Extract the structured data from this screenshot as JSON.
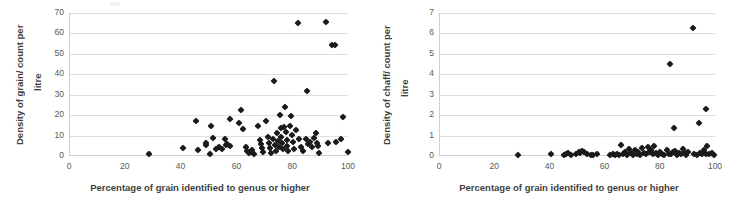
{
  "figure": {
    "background": "#ffffff",
    "marker_color": "#1a1a1a",
    "gridline_color": "#dedede",
    "axis_color": "#d0d0d0",
    "tick_label_color": "#595959",
    "title_color": "#3f3f3f"
  },
  "chart_data": [
    {
      "type": "scatter",
      "title": "",
      "xlabel": "Percentage of grain identified to genus or higher",
      "ylabel_line1": "Density of grain/ count per",
      "ylabel_line2": "litre",
      "xlim": [
        0,
        100
      ],
      "ylim": [
        0,
        70
      ],
      "xticks": [
        0,
        20,
        40,
        60,
        80,
        100
      ],
      "yticks": [
        0,
        10,
        20,
        30,
        40,
        50,
        60,
        70
      ],
      "grid": true,
      "legend": "none",
      "marker": "diamond",
      "points": [
        [
          28.4,
          1.2
        ],
        [
          40.6,
          3.8
        ],
        [
          45.3,
          17.3
        ],
        [
          46.0,
          3.0
        ],
        [
          48.6,
          5.2
        ],
        [
          48.8,
          6.4
        ],
        [
          50.4,
          14.6
        ],
        [
          50.0,
          0.8
        ],
        [
          51.2,
          8.9
        ],
        [
          52.5,
          3.5
        ],
        [
          53.3,
          4.4
        ],
        [
          54.6,
          3.3
        ],
        [
          55.7,
          8.2
        ],
        [
          56.0,
          5.6
        ],
        [
          56.3,
          6.1
        ],
        [
          57.2,
          18.1
        ],
        [
          57.4,
          5.0
        ],
        [
          60.6,
          16.3
        ],
        [
          61.4,
          22.5
        ],
        [
          62.0,
          13.1
        ],
        [
          63.0,
          4.6
        ],
        [
          63.4,
          2.3
        ],
        [
          64.1,
          1.5
        ],
        [
          64.6,
          1.9
        ],
        [
          65.4,
          3.0
        ],
        [
          66.0,
          0.9
        ],
        [
          67.4,
          14.8
        ],
        [
          68.0,
          7.9
        ],
        [
          68.4,
          6.0
        ],
        [
          68.9,
          4.0
        ],
        [
          69.2,
          2.0
        ],
        [
          70.3,
          17.1
        ],
        [
          70.8,
          9.4
        ],
        [
          71.2,
          6.6
        ],
        [
          71.6,
          3.9
        ],
        [
          72.0,
          1.6
        ],
        [
          72.7,
          8.4
        ],
        [
          73.0,
          36.8
        ],
        [
          73.4,
          5.4
        ],
        [
          73.8,
          2.6
        ],
        [
          74.3,
          11.4
        ],
        [
          74.6,
          7.5
        ],
        [
          74.9,
          4.6
        ],
        [
          75.2,
          19.9
        ],
        [
          75.5,
          13.8
        ],
        [
          75.8,
          9.1
        ],
        [
          76.1,
          6.2
        ],
        [
          76.4,
          3.4
        ],
        [
          76.8,
          14.3
        ],
        [
          77.0,
          23.9
        ],
        [
          77.4,
          11.6
        ],
        [
          77.7,
          8.0
        ],
        [
          77.9,
          5.0
        ],
        [
          78.3,
          2.5
        ],
        [
          78.8,
          14.6
        ],
        [
          79.2,
          19.8
        ],
        [
          79.6,
          10.2
        ],
        [
          79.9,
          6.7
        ],
        [
          80.3,
          3.2
        ],
        [
          81.0,
          12.9
        ],
        [
          81.6,
          64.9
        ],
        [
          82.2,
          8.3
        ],
        [
          82.8,
          4.2
        ],
        [
          83.4,
          2.3
        ],
        [
          84.5,
          8.1
        ],
        [
          84.9,
          31.7
        ],
        [
          85.3,
          5.7
        ],
        [
          85.9,
          6.9
        ],
        [
          86.6,
          4.6
        ],
        [
          87.4,
          9.0
        ],
        [
          88.0,
          11.3
        ],
        [
          88.6,
          6.2
        ],
        [
          89.0,
          4.7
        ],
        [
          89.4,
          1.7
        ],
        [
          91.8,
          65.5
        ],
        [
          92.6,
          6.4
        ],
        [
          94.0,
          54.4
        ],
        [
          95.1,
          54.4
        ],
        [
          95.4,
          7.0
        ],
        [
          97.2,
          8.4
        ],
        [
          97.8,
          19.0
        ],
        [
          99.5,
          2.0
        ]
      ]
    },
    {
      "type": "scatter",
      "title": "",
      "xlabel": "Percentage of grain identified to genus or higher",
      "ylabel_line1": "Density of chaff/ count per",
      "ylabel_line2": "litre",
      "xlim": [
        0,
        100
      ],
      "ylim": [
        0,
        7
      ],
      "xticks": [
        0,
        20,
        40,
        60,
        80,
        100
      ],
      "yticks": [
        0,
        1,
        2,
        3,
        4,
        5,
        6,
        7
      ],
      "grid": true,
      "legend": "none",
      "marker": "diamond",
      "points": [
        [
          28.4,
          0.07
        ],
        [
          40.2,
          0.08
        ],
        [
          44.8,
          0.06
        ],
        [
          45.6,
          0.12
        ],
        [
          46.4,
          0.17
        ],
        [
          47.6,
          0.06
        ],
        [
          49.2,
          0.09
        ],
        [
          50.2,
          0.2
        ],
        [
          50.9,
          0.14
        ],
        [
          51.6,
          0.26
        ],
        [
          52.3,
          0.19
        ],
        [
          53.1,
          0.1
        ],
        [
          54.6,
          0.07
        ],
        [
          55.5,
          0.06
        ],
        [
          56.8,
          0.08
        ],
        [
          61.6,
          0.06
        ],
        [
          62.5,
          0.09
        ],
        [
          63.3,
          0.05
        ],
        [
          64.2,
          0.12
        ],
        [
          65.0,
          0.07
        ],
        [
          65.7,
          0.55
        ],
        [
          66.4,
          0.1
        ],
        [
          67.1,
          0.22
        ],
        [
          67.8,
          0.07
        ],
        [
          68.5,
          0.35
        ],
        [
          69.2,
          0.13
        ],
        [
          69.9,
          0.06
        ],
        [
          70.6,
          0.3
        ],
        [
          71.2,
          0.1
        ],
        [
          71.9,
          0.21
        ],
        [
          72.6,
          0.06
        ],
        [
          73.3,
          0.38
        ],
        [
          74.0,
          0.14
        ],
        [
          74.7,
          0.08
        ],
        [
          75.3,
          0.44
        ],
        [
          75.9,
          0.19
        ],
        [
          76.5,
          0.31
        ],
        [
          77.1,
          0.09
        ],
        [
          77.7,
          0.48
        ],
        [
          78.3,
          0.15
        ],
        [
          79.0,
          0.06
        ],
        [
          79.8,
          0.2
        ],
        [
          80.6,
          0.1
        ],
        [
          81.3,
          0.07
        ],
        [
          82.1,
          0.27
        ],
        [
          82.8,
          0.12
        ],
        [
          83.5,
          4.52
        ],
        [
          83.8,
          0.08
        ],
        [
          84.4,
          0.18
        ],
        [
          84.9,
          1.35
        ],
        [
          85.2,
          0.25
        ],
        [
          85.8,
          0.06
        ],
        [
          86.5,
          0.13
        ],
        [
          87.2,
          0.09
        ],
        [
          88.0,
          0.32
        ],
        [
          88.7,
          0.15
        ],
        [
          89.3,
          0.07
        ],
        [
          89.9,
          0.21
        ],
        [
          91.8,
          6.25
        ],
        [
          92.1,
          0.09
        ],
        [
          93.0,
          0.05
        ],
        [
          94.0,
          1.62
        ],
        [
          94.3,
          0.16
        ],
        [
          95.0,
          0.08
        ],
        [
          95.6,
          0.27
        ],
        [
          96.2,
          0.12
        ],
        [
          96.5,
          2.28
        ],
        [
          96.9,
          0.5
        ],
        [
          97.6,
          0.09
        ],
        [
          98.4,
          0.14
        ],
        [
          99.3,
          0.07
        ]
      ]
    }
  ]
}
